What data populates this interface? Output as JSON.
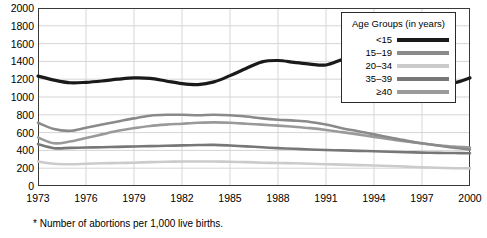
{
  "chart_data": {
    "type": "line",
    "title": "",
    "xlabel": "",
    "ylabel": "",
    "xlim": [
      1973,
      2000
    ],
    "ylim": [
      0,
      2000
    ],
    "grid": true,
    "legend_position": "top-right",
    "legend_title": "Age Groups (in years)",
    "footnote": "* Number of abortions per 1,000 live births.",
    "yticks": [
      0,
      200,
      400,
      600,
      800,
      1000,
      1200,
      1400,
      1600,
      1800,
      2000
    ],
    "xticks": [
      1973,
      1976,
      1979,
      1982,
      1985,
      1988,
      1991,
      1994,
      1997,
      2000
    ],
    "x": [
      1973,
      1974,
      1975,
      1976,
      1977,
      1978,
      1979,
      1980,
      1981,
      1982,
      1983,
      1984,
      1985,
      1986,
      1987,
      1988,
      1989,
      1990,
      1991,
      1992,
      1993,
      1994,
      1995,
      1996,
      1997,
      1998,
      1999,
      2000
    ],
    "series": [
      {
        "name": "<15",
        "color": "#1a1a1a",
        "width": 3.2,
        "values": [
          1235,
          1190,
          1160,
          1165,
          1180,
          1200,
          1215,
          1210,
          1180,
          1150,
          1140,
          1170,
          1240,
          1320,
          1395,
          1410,
          1390,
          1370,
          1360,
          1420,
          1470,
          1480,
          1440,
          1395,
          1310,
          1180,
          1160,
          1215
        ]
      },
      {
        "name": "15–19",
        "color": "#8a8a8a",
        "width": 2.6,
        "values": [
          710,
          640,
          620,
          655,
          690,
          725,
          760,
          790,
          800,
          800,
          795,
          800,
          795,
          780,
          760,
          745,
          735,
          720,
          690,
          650,
          615,
          580,
          545,
          510,
          480,
          455,
          430,
          410
        ]
      },
      {
        "name": "20–34",
        "color": "#cbcbcb",
        "width": 2.6,
        "values": [
          275,
          250,
          245,
          250,
          255,
          258,
          262,
          268,
          272,
          275,
          276,
          275,
          272,
          268,
          262,
          258,
          255,
          250,
          245,
          240,
          235,
          230,
          225,
          218,
          210,
          205,
          200,
          198
        ]
      },
      {
        "name": "35–39",
        "color": "#777777",
        "width": 2.6,
        "values": [
          470,
          425,
          428,
          432,
          436,
          440,
          444,
          448,
          452,
          456,
          460,
          462,
          455,
          445,
          435,
          425,
          418,
          410,
          405,
          400,
          395,
          390,
          385,
          380,
          375,
          372,
          370,
          368
        ]
      },
      {
        "name": "≥40",
        "color": "#9a9a9a",
        "width": 2.6,
        "values": [
          545,
          480,
          500,
          540,
          580,
          620,
          650,
          675,
          690,
          700,
          710,
          715,
          710,
          700,
          690,
          678,
          665,
          650,
          630,
          605,
          580,
          552,
          525,
          500,
          478,
          458,
          442,
          432
        ]
      }
    ]
  },
  "axes": {
    "y_labels": [
      "2000",
      "1800",
      "1600",
      "1400",
      "1200",
      "1000",
      "800",
      "600",
      "400",
      "200",
      "0"
    ],
    "x_labels": [
      "1973",
      "1976",
      "1979",
      "1982",
      "1985",
      "1988",
      "1991",
      "1994",
      "1997",
      "2000"
    ]
  },
  "legend": {
    "title": "Age Groups (in years)",
    "items": [
      {
        "label": "<15",
        "color": "#1a1a1a",
        "thickness": 4
      },
      {
        "label": "15–19",
        "color": "#8a8a8a",
        "thickness": 4
      },
      {
        "label": "20–34",
        "color": "#cbcbcb",
        "thickness": 4
      },
      {
        "label": "35–39",
        "color": "#777777",
        "thickness": 4
      },
      {
        "label": "≥40",
        "color": "#9a9a9a",
        "thickness": 4
      }
    ]
  },
  "footnote": {
    "text": "* Number of abortions per 1,000 live births."
  }
}
